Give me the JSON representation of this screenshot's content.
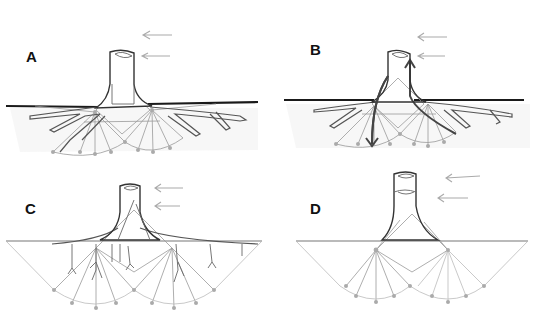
{
  "figure": {
    "panels": [
      {
        "id": "A",
        "label": "A",
        "features": [
          "stump",
          "horizontal ground line",
          "branched lateral roots",
          "root-plate fan geometry",
          "two wind arrows"
        ]
      },
      {
        "id": "B",
        "label": "B",
        "features": [
          "stump",
          "load-path arrows through roots (down on left, up on right)",
          "lateral roots",
          "fan geometry",
          "two wind arrows"
        ]
      },
      {
        "id": "C",
        "label": "C",
        "features": [
          "stump",
          "sinker roots",
          "wide root-plate fan geometry",
          "two wind arrows"
        ]
      },
      {
        "id": "D",
        "label": "D",
        "features": [
          "tall stump with cut ring",
          "overlapping fan geometry",
          "no drawn roots",
          "two wind arrows"
        ]
      }
    ],
    "colors": {
      "ink": "#1a1a1a",
      "root": "#555555",
      "geometry": "#999999",
      "arrow": "#aaaaaa",
      "soil": "#f1f1f1"
    }
  }
}
